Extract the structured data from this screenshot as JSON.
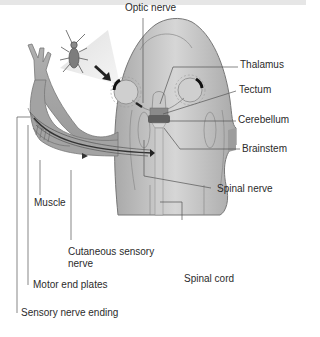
{
  "diagram": {
    "labels": {
      "optic_nerve": "Optic nerve",
      "thalamus": "Thalamus",
      "tectum": "Tectum",
      "cerebellum": "Cerebellum",
      "brainstem": "Brainstem",
      "spinal_nerve": "Spinal nerve",
      "muscle": "Muscle",
      "cutaneous_line1": "Cutaneous sensory",
      "cutaneous_line2": "nerve",
      "spinal_cord": "Spinal cord",
      "motor_end_plates": "Motor end plates",
      "sensory_nerve_ending": "Sensory nerve ending"
    },
    "icons": [
      "insect-prey",
      "arrow-to-eye",
      "frog-head",
      "frog-forelimb"
    ],
    "colors": {
      "body_fill": "#b9b9b9",
      "body_light": "#d8d8d8",
      "outline": "#7a7a7a",
      "nerve": "#3a3a3a",
      "brain": "#6b6b6b",
      "leader_line": "#555555",
      "text": "#2b2b2b"
    }
  }
}
